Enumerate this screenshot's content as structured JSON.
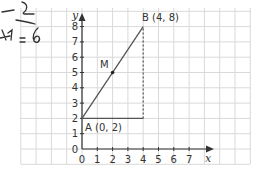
{
  "diagram": {
    "axes": {
      "x_label": "x",
      "y_label": "y",
      "x_ticks": [
        "0",
        "1",
        "2",
        "3",
        "4",
        "5",
        "6",
        "7"
      ],
      "y_ticks": [
        "0",
        "1",
        "2",
        "3",
        "4",
        "5",
        "6",
        "7",
        "8"
      ]
    },
    "points": {
      "A": {
        "name": "A",
        "label": "A  (0, 2)",
        "x": 0,
        "y": 2
      },
      "B": {
        "name": "B",
        "label": "B  (4, 8)",
        "x": 4,
        "y": 8
      },
      "M": {
        "name": "M",
        "label": "M",
        "x": 2,
        "y": 5
      }
    },
    "segments": [
      {
        "from": "A",
        "to": "B",
        "style": "solid"
      },
      {
        "from": "A",
        "to": "(4,2)",
        "style": "solid"
      },
      {
        "from": "(4,2)",
        "to": "B",
        "style": "dashed"
      }
    ],
    "handwriting": {
      "line1": "–2",
      "line2": "–",
      "line3": "½=6"
    },
    "colors": {
      "grid": "#d9d9d9",
      "axis": "#333333",
      "line": "#555555"
    }
  }
}
